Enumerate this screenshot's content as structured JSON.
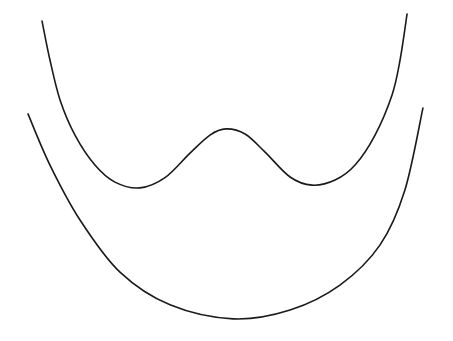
{
  "chart_data": {
    "type": "line",
    "title": "",
    "xlabel": "",
    "ylabel": "",
    "xlim": [
      -1.26,
      1.26
    ],
    "ylim": [
      0,
      10
    ],
    "grid": false,
    "axes_visible": false,
    "legend": "none",
    "series": [
      {
        "name": "double-well",
        "color": "#1a1a1a",
        "x": [
          -1.022,
          -0.978,
          -0.922,
          -0.839,
          -0.728,
          -0.617,
          -0.478,
          -0.339,
          -0.2,
          -0.089,
          0.0,
          0.106,
          0.217,
          0.356,
          0.478,
          0.606,
          0.717,
          0.828,
          0.922,
          0.967,
          1.006
        ],
        "y": [
          9.38,
          8.24,
          7.07,
          6.04,
          5.16,
          4.66,
          4.49,
          4.79,
          5.51,
          6.04,
          6.22,
          6.07,
          5.54,
          4.81,
          4.57,
          4.72,
          5.16,
          6.04,
          7.21,
          8.24,
          9.59
        ]
      },
      {
        "name": "parabola",
        "color": "#1a1a1a",
        "x": [
          -1.1,
          -0.978,
          -0.811,
          -0.589,
          -0.311,
          0.039,
          0.356,
          0.633,
          0.856,
          0.994,
          1.094
        ],
        "y": [
          6.66,
          5.16,
          3.55,
          2.02,
          1.06,
          0.65,
          0.91,
          1.64,
          2.82,
          4.43,
          6.83
        ]
      }
    ]
  }
}
